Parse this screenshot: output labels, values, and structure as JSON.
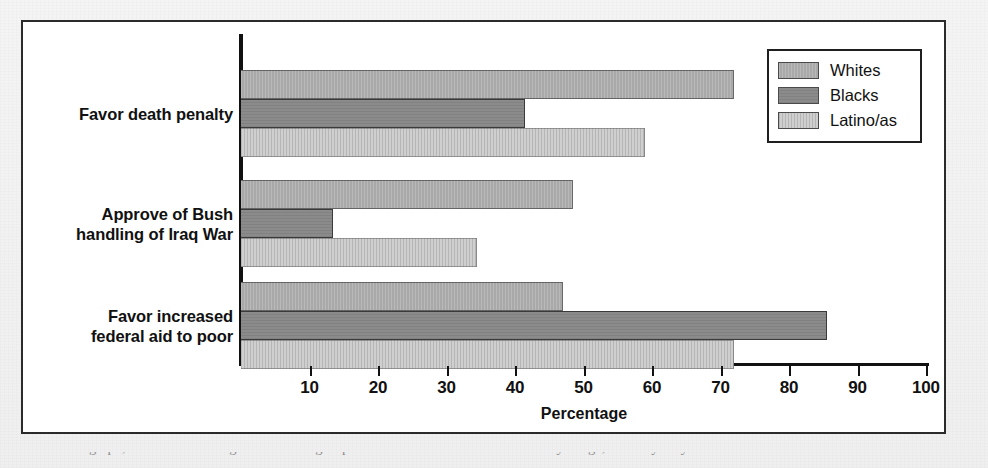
{
  "figure": {
    "x_axis_title": "Percentage",
    "caption_cropped": "shown on the graph, differences among racial/ethnic groups on these social issues are not always large, and they vary"
  },
  "legend": {
    "position": "top-right",
    "items": [
      {
        "label": "Whites",
        "key": "whites",
        "color": "#a9a9a9"
      },
      {
        "label": "Blacks",
        "key": "blacks",
        "color": "#8b8b8b"
      },
      {
        "label": "Latino/as",
        "key": "latinos",
        "color": "#cfcfcf"
      }
    ]
  },
  "chart_data": {
    "type": "bar",
    "orientation": "horizontal",
    "title": "",
    "xlabel": "Percentage",
    "ylabel": "",
    "xlim": [
      0,
      100
    ],
    "xticks": [
      10,
      20,
      30,
      40,
      50,
      60,
      70,
      80,
      90,
      100
    ],
    "grid": false,
    "legend_position": "top-right",
    "categories": [
      "Favor death penalty",
      "Approve of Bush handling of Iraq War",
      "Favor increased federal aid to poor"
    ],
    "category_label_lines": [
      [
        "Favor death penalty"
      ],
      [
        "Approve of Bush",
        "handling of Iraq War"
      ],
      [
        "Favor increased",
        "federal aid to poor"
      ]
    ],
    "series": [
      {
        "name": "Whites",
        "color": "#a9a9a9",
        "values": [
          72,
          48.5,
          47
        ]
      },
      {
        "name": "Blacks",
        "color": "#8b8b8b",
        "values": [
          41.5,
          13.5,
          85.5
        ]
      },
      {
        "name": "Latino/as",
        "color": "#cfcfcf",
        "values": [
          59,
          34.5,
          72
        ]
      }
    ]
  }
}
